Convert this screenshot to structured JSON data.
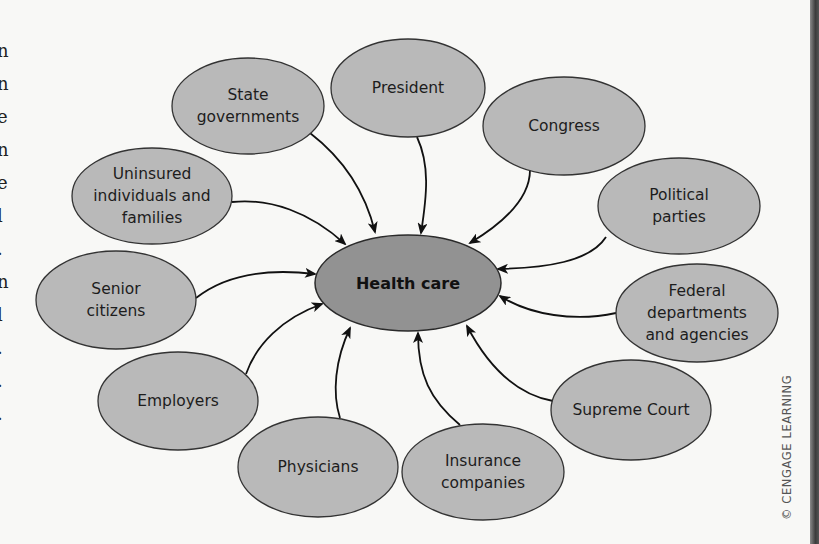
{
  "diagram": {
    "center": {
      "id": "health-care",
      "label": "Health care",
      "cx": 408,
      "cy": 283,
      "rx": 93,
      "ry": 48
    },
    "nodes": [
      {
        "id": "state-governments",
        "lines": [
          "State",
          "governments"
        ],
        "cx": 248,
        "cy": 106,
        "rx": 76,
        "ry": 48
      },
      {
        "id": "president",
        "lines": [
          "President"
        ],
        "cx": 408,
        "cy": 88,
        "rx": 77,
        "ry": 49
      },
      {
        "id": "congress",
        "lines": [
          "Congress"
        ],
        "cx": 564,
        "cy": 126,
        "rx": 81,
        "ry": 49
      },
      {
        "id": "political-parties",
        "lines": [
          "Political",
          "parties"
        ],
        "cx": 679,
        "cy": 206,
        "rx": 81,
        "ry": 48
      },
      {
        "id": "federal-departments",
        "lines": [
          "Federal",
          "departments",
          "and agencies"
        ],
        "cx": 697,
        "cy": 313,
        "rx": 81,
        "ry": 49
      },
      {
        "id": "supreme-court",
        "lines": [
          "Supreme Court"
        ],
        "cx": 631,
        "cy": 410,
        "rx": 80,
        "ry": 50
      },
      {
        "id": "insurance-companies",
        "lines": [
          "Insurance",
          "companies"
        ],
        "cx": 483,
        "cy": 472,
        "rx": 81,
        "ry": 48
      },
      {
        "id": "physicians",
        "lines": [
          "Physicians"
        ],
        "cx": 318,
        "cy": 467,
        "rx": 80,
        "ry": 50
      },
      {
        "id": "employers",
        "lines": [
          "Employers"
        ],
        "cx": 178,
        "cy": 401,
        "rx": 80,
        "ry": 49
      },
      {
        "id": "senior-citizens",
        "lines": [
          "Senior",
          "citizens"
        ],
        "cx": 116,
        "cy": 300,
        "rx": 80,
        "ry": 49
      },
      {
        "id": "uninsured",
        "lines": [
          "Uninsured",
          "individuals and",
          "families"
        ],
        "cx": 152,
        "cy": 196,
        "rx": 80,
        "ry": 48
      }
    ],
    "edges": [
      {
        "from": "state-governments",
        "d": "M 310 133 C 345 160, 366 195, 375 232"
      },
      {
        "from": "president",
        "d": "M 417 137 C 430 165, 427 195, 421 233"
      },
      {
        "from": "congress",
        "d": "M 530 170 C 530 200, 500 225, 470 243"
      },
      {
        "from": "political-parties",
        "d": "M 606 237 C 590 262, 545 268, 498 269"
      },
      {
        "from": "federal-departments",
        "d": "M 616 313 C 575 322, 530 315, 500 296"
      },
      {
        "from": "supreme-court",
        "d": "M 553 401 C 520 395, 490 370, 467 326"
      },
      {
        "from": "insurance-companies",
        "d": "M 460 425 C 430 400, 418 375, 418 333"
      },
      {
        "from": "physicians",
        "d": "M 340 418 C 332 393, 335 360, 350 328"
      },
      {
        "from": "employers",
        "d": "M 246 374 C 256 345, 282 318, 322 304"
      },
      {
        "from": "senior-citizens",
        "d": "M 196 298 C 225 275, 265 268, 315 274"
      },
      {
        "from": "uninsured",
        "d": "M 232 202 C 270 198, 310 212, 345 244"
      }
    ]
  },
  "credit": "© CENGAGE LEARNING",
  "margin_fragments": [
    "n",
    "n",
    "e",
    "n",
    "e",
    "l",
    ".",
    "n",
    "l",
    ".",
    ".",
    "."
  ],
  "colors": {
    "outer_fill": "#b9b9b9",
    "center_fill": "#929292",
    "stroke": "#333333",
    "background": "#f8f8f6"
  }
}
